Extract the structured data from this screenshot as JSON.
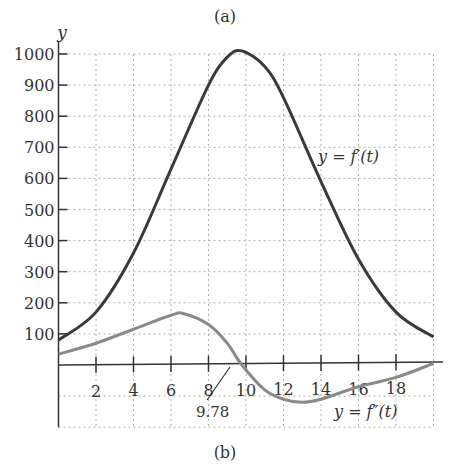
{
  "labels": {
    "top": "(a)",
    "bottom": "(b)",
    "y_axis": "y",
    "fprime": "y = f′(t)",
    "fdouble": "y = f″(t)",
    "annotation": "9.78"
  },
  "colors": {
    "fprime": "#3a3a3a",
    "fdouble": "#8a8a8a",
    "axis": "#333333",
    "grid": "#b0b0b0"
  },
  "chart_data": {
    "type": "line",
    "title": "",
    "xlabel": "t",
    "ylabel": "y",
    "xlim": [
      0,
      20
    ],
    "ylim": [
      -200,
      1050
    ],
    "x_ticks": [
      2,
      4,
      6,
      8,
      10,
      12,
      14,
      16,
      18
    ],
    "y_ticks": [
      100,
      200,
      300,
      400,
      500,
      600,
      700,
      800,
      900,
      1000
    ],
    "grid": true,
    "annotations": [
      {
        "text": "9.78",
        "x": 9.78,
        "y": 0
      }
    ],
    "series": [
      {
        "name": "y = f'(t)",
        "x": [
          0,
          2,
          4,
          6,
          8,
          9,
          9.78,
          11,
          12,
          14,
          16,
          18,
          20
        ],
        "values": [
          80,
          170,
          360,
          630,
          900,
          990,
          1010,
          960,
          860,
          590,
          340,
          170,
          90
        ]
      },
      {
        "name": "y = f''(t)",
        "x": [
          0,
          2,
          4,
          6,
          6.7,
          8,
          9,
          9.78,
          11,
          12,
          13,
          14,
          16,
          18,
          20
        ],
        "values": [
          35,
          70,
          115,
          160,
          165,
          130,
          70,
          0,
          -80,
          -110,
          -120,
          -110,
          -70,
          -40,
          5
        ]
      }
    ]
  }
}
